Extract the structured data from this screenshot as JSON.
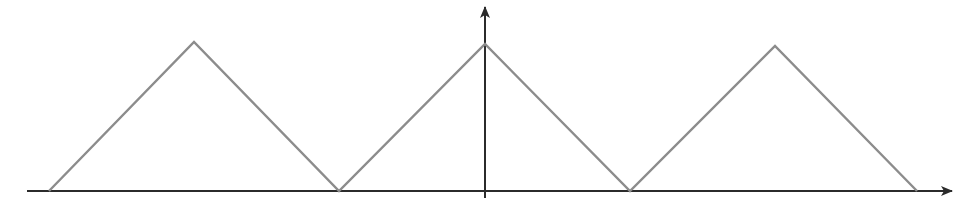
{
  "chart_data": {
    "type": "line",
    "title": "",
    "xlabel": "",
    "ylabel": "",
    "grid": false,
    "legend": null,
    "series": [
      {
        "name": "triangle-wave",
        "color": "#8c8c8c",
        "x_px": [
          49,
          194,
          339,
          485,
          630,
          775,
          917
        ],
        "y_px": [
          191,
          42,
          191,
          44,
          191,
          46,
          191
        ]
      }
    ],
    "x_normalized": [
      -3,
      -2,
      -1,
      0,
      1,
      2,
      3
    ],
    "y_normalized": [
      0,
      1,
      0,
      1,
      0,
      1,
      0
    ],
    "axes": {
      "color": "#2b2b2b",
      "x_axis": {
        "y": 191,
        "x_start": 27,
        "x_end": 952
      },
      "y_axis": {
        "x": 485,
        "y_start": 198,
        "y_end": 7
      }
    }
  }
}
